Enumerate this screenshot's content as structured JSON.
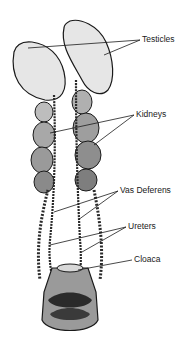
{
  "diagram": {
    "labels": {
      "testicles": "Testicles",
      "kidneys": "Kidneys",
      "vas_deferens": "Vas Deferens",
      "ureters": "Ureters",
      "cloaca": "Cloaca"
    },
    "colors": {
      "ink": "#1a1a1a",
      "organ_fill": "#e4e4e4",
      "shade": "#6a6a6a",
      "dark": "#2a2a2a"
    }
  }
}
